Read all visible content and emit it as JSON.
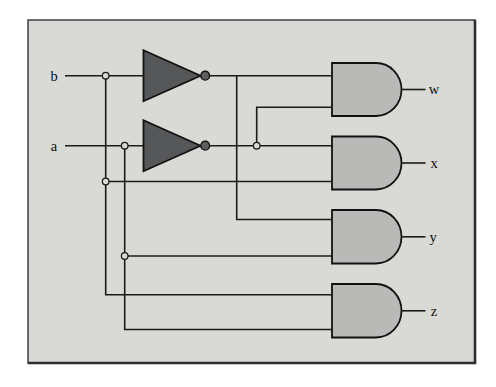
{
  "figure": {
    "type": "logic-circuit-diagram"
  },
  "inputs": [
    "b",
    "a"
  ],
  "outputs": [
    "w",
    "x",
    "y",
    "z"
  ],
  "logic": {
    "w": "(NOT b) AND (NOT a)",
    "x": "(NOT a) AND b",
    "y": "(NOT b) AND a",
    "z": "b AND a"
  },
  "colors": {
    "page_bg": "#ffffff",
    "panel_bg": "#d9d9d6",
    "panel_border": "#4a4a4a",
    "panel_border_heavy": "#2e2e2e",
    "wire": "#1b1b1b",
    "gate_stroke": "#111111",
    "and_fill": "#b9bab8",
    "not_fill": "#565759",
    "bubble_fill": "#5c5e60",
    "label_color": "#111111"
  },
  "diagram": {
    "canvas": {
      "width": 496,
      "height": 387
    },
    "panel": {
      "x": 28,
      "y": 20,
      "width": 447,
      "height": 343
    },
    "wires": [
      {
        "name": "b-input-wire",
        "pts": [
          [
            65,
            75.7
          ],
          [
            144,
            75.7
          ]
        ]
      },
      {
        "name": "a-input-wire",
        "pts": [
          [
            65,
            145.7
          ],
          [
            144,
            145.7
          ]
        ]
      },
      {
        "name": "not-b-output-wire",
        "pts": [
          [
            209,
            75.7
          ],
          [
            332.5,
            75.7
          ]
        ]
      },
      {
        "name": "not-a-output-wire",
        "pts": [
          [
            209,
            145.7
          ],
          [
            332.5,
            145.7
          ]
        ]
      },
      {
        "name": "w-lower-input-branch",
        "pts": [
          [
            256.7,
            145.7
          ],
          [
            256.7,
            107.3
          ],
          [
            332.5,
            107.3
          ]
        ]
      },
      {
        "name": "b-tap-vertical-to-z",
        "pts": [
          [
            105.7,
            75.7
          ],
          [
            105.7,
            294.7
          ],
          [
            332.5,
            294.7
          ]
        ]
      },
      {
        "name": "x-lower-input-branch",
        "pts": [
          [
            105.7,
            181.5
          ],
          [
            332.5,
            181.5
          ]
        ]
      },
      {
        "name": "a-tap-vertical-to-z",
        "pts": [
          [
            124.7,
            145.7
          ],
          [
            124.7,
            329.5
          ],
          [
            332.5,
            329.5
          ]
        ]
      },
      {
        "name": "y-lower-input-branch",
        "pts": [
          [
            124.7,
            256
          ],
          [
            332.5,
            256
          ]
        ]
      },
      {
        "name": "y-upper-input-branch",
        "pts": [
          [
            236.7,
            75.7
          ],
          [
            236.7,
            219.5
          ],
          [
            332.5,
            219.5
          ]
        ]
      },
      {
        "name": "w-output-wire",
        "pts": [
          [
            401.5,
            89.5
          ],
          [
            425.5,
            89.5
          ]
        ]
      },
      {
        "name": "x-output-wire",
        "pts": [
          [
            401.5,
            163
          ],
          [
            425.5,
            163
          ]
        ]
      },
      {
        "name": "y-output-wire",
        "pts": [
          [
            401.5,
            236.8
          ],
          [
            425.5,
            236.8
          ]
        ]
      },
      {
        "name": "z-output-wire",
        "pts": [
          [
            401.5,
            310.8
          ],
          [
            425.5,
            310.8
          ]
        ]
      }
    ],
    "not_gates": [
      {
        "name": "not-gate-b",
        "left": 143.5,
        "apex": 200.5,
        "cy": 75.7,
        "half_h": 25.5,
        "bubble_cx": 205.2,
        "bubble_r": 4.4
      },
      {
        "name": "not-gate-a",
        "left": 143.5,
        "apex": 200.5,
        "cy": 145.7,
        "half_h": 25.5,
        "bubble_cx": 205.2,
        "bubble_r": 4.4
      }
    ],
    "and_gates": [
      {
        "name": "and-gate-w",
        "left": 332,
        "top": 63,
        "bottom": 116,
        "inputs": [
          "b'",
          "a'"
        ]
      },
      {
        "name": "and-gate-x",
        "left": 332,
        "top": 136.5,
        "bottom": 189.5,
        "inputs": [
          "a'",
          "b"
        ]
      },
      {
        "name": "and-gate-y",
        "left": 332,
        "top": 210,
        "bottom": 263.5,
        "inputs": [
          "b'",
          "a"
        ]
      },
      {
        "name": "and-gate-z",
        "left": 332,
        "top": 284,
        "bottom": 337.5,
        "inputs": [
          "b",
          "a"
        ]
      }
    ],
    "junctions": [
      {
        "name": "junction-dot-b-line",
        "x": 105.7,
        "y": 75.7
      },
      {
        "name": "junction-dot-a-line",
        "x": 124.7,
        "y": 145.7
      },
      {
        "name": "junction-dot-b-branch",
        "x": 105.7,
        "y": 181.5
      },
      {
        "name": "junction-dot-a-prime",
        "x": 256.7,
        "y": 145.7
      },
      {
        "name": "junction-dot-a-branch",
        "x": 124.7,
        "y": 256
      }
    ],
    "labels": [
      {
        "name": "input-label-b",
        "text": "b",
        "x": 54,
        "y": 80.5
      },
      {
        "name": "input-label-a",
        "text": "a",
        "x": 54,
        "y": 150.5
      },
      {
        "name": "output-label-w",
        "text": "w",
        "x": 434,
        "y": 94
      },
      {
        "name": "output-label-x",
        "text": "x",
        "x": 434,
        "y": 167.5
      },
      {
        "name": "output-label-y",
        "text": "y",
        "x": 433,
        "y": 241.5
      },
      {
        "name": "output-label-z",
        "text": "z",
        "x": 434,
        "y": 315.5
      }
    ],
    "label_font_size": 14.5
  }
}
